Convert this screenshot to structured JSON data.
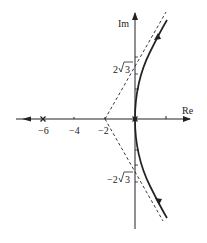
{
  "diagram": {
    "type": "root-locus",
    "axes": {
      "x_label": "Re",
      "y_label": "Im",
      "x_ticks": [
        {
          "value": -6,
          "label": "−6"
        },
        {
          "value": -4,
          "label": "−4"
        },
        {
          "value": -2,
          "label": "−2"
        },
        {
          "value": 2,
          "label": ""
        }
      ],
      "y_marks": [
        {
          "value": 3.464,
          "label_main": "2",
          "label_root": "3",
          "label_prefix": ""
        },
        {
          "value": -3.464,
          "label_main": "2",
          "label_root": "3",
          "label_prefix": "−"
        }
      ]
    },
    "poles": [
      {
        "re": -6,
        "im": 0,
        "marker": "x"
      },
      {
        "re": 0,
        "im": 0,
        "marker": "x",
        "multiplicity": 2
      }
    ],
    "asymptotes": {
      "centroid": -2,
      "angles_deg": [
        60,
        -60,
        180
      ],
      "style": "dashed"
    },
    "branches": [
      {
        "name": "upper-branch",
        "from": "origin",
        "direction": "up-right"
      },
      {
        "name": "lower-branch",
        "from": "origin",
        "direction": "down-right"
      },
      {
        "name": "left-branch",
        "from": "-6",
        "direction": "left"
      }
    ],
    "colors": {
      "line": "#222222",
      "background": "#ffffff"
    }
  }
}
